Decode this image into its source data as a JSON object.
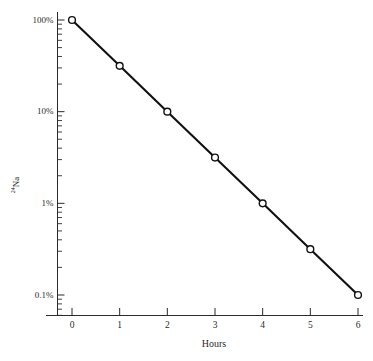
{
  "chart_data": {
    "type": "line",
    "title": "",
    "subtitle": "",
    "xlabel": "Hours",
    "ylabel": "24Na",
    "ylabel_sup": "24",
    "ylabel_base": "Na",
    "yscale": "log",
    "xscale": "linear",
    "xlim": [
      0,
      6
    ],
    "ylim": [
      0.1,
      100
    ],
    "ylim_unit": "%",
    "grid": false,
    "legend": null,
    "x": [
      0,
      1,
      2,
      3,
      4,
      5,
      6
    ],
    "values": [
      100,
      31.6,
      10,
      3.16,
      1,
      0.316,
      0.1
    ],
    "series": [
      {
        "name": "24Na decay",
        "marker": "open-circle",
        "line_color": "#111111",
        "marker_fill": "#ffffff",
        "points": [
          {
            "x": 0,
            "y": 100
          },
          {
            "x": 1,
            "y": 31.6
          },
          {
            "x": 2,
            "y": 10
          },
          {
            "x": 3,
            "y": 3.16
          },
          {
            "x": 4,
            "y": 1
          },
          {
            "x": 5,
            "y": 0.316
          },
          {
            "x": 6,
            "y": 0.1
          }
        ]
      }
    ],
    "x_ticks": [
      {
        "value": 0,
        "label": "0"
      },
      {
        "value": 1,
        "label": "1"
      },
      {
        "value": 2,
        "label": "2"
      },
      {
        "value": 3,
        "label": "3"
      },
      {
        "value": 4,
        "label": "4"
      },
      {
        "value": 5,
        "label": "5"
      },
      {
        "value": 6,
        "label": "6"
      }
    ],
    "y_ticks_major": [
      {
        "value": 100,
        "label": "100%"
      },
      {
        "value": 10,
        "label": "10%"
      },
      {
        "value": 1,
        "label": "1%"
      },
      {
        "value": 0.1,
        "label": "0.1%"
      }
    ],
    "y_ticks_minor_multipliers": [
      9,
      8,
      7,
      6,
      5,
      4,
      3,
      2
    ],
    "annotations": []
  },
  "axis_labels": {
    "x_title": "Hours",
    "y_title_sup": "24",
    "y_title_base": "Na"
  },
  "tick_text": {
    "y0": "100%",
    "y1": "10%",
    "y2": "1%",
    "y3": "0.1%",
    "x0": "0",
    "x1": "1",
    "x2": "2",
    "x3": "3",
    "x4": "4",
    "x5": "5",
    "x6": "6"
  },
  "colors": {
    "line": "#111111",
    "axis": "#2b2b2b",
    "marker_fill": "#ffffff",
    "background": "#ffffff",
    "text": "#2b2b2b"
  }
}
